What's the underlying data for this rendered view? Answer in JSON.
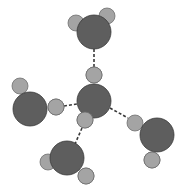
{
  "diagram": {
    "type": "molecular-structure",
    "colors": {
      "oxygen_fill": "#5e5e5e",
      "oxygen_stroke": "#3a3a3a",
      "hydrogen_fill": "#a4a4a4",
      "hydrogen_stroke": "#6e6e6e",
      "bond": "#3a3a3a",
      "background": "#ffffff"
    },
    "molecules": [
      {
        "id": "center",
        "oxygen": {
          "cx": 94,
          "cy": 101,
          "r": 17
        },
        "hydrogens": [
          {
            "cx": 94,
            "cy": 75,
            "r": 8
          },
          {
            "cx": 85,
            "cy": 120,
            "r": 8
          }
        ]
      },
      {
        "id": "top",
        "oxygen": {
          "cx": 94,
          "cy": 32,
          "r": 17
        },
        "hydrogens": [
          {
            "cx": 76,
            "cy": 23,
            "r": 8
          },
          {
            "cx": 107,
            "cy": 16,
            "r": 8
          }
        ]
      },
      {
        "id": "left",
        "oxygen": {
          "cx": 30,
          "cy": 109,
          "r": 17
        },
        "hydrogens": [
          {
            "cx": 20,
            "cy": 86,
            "r": 8
          },
          {
            "cx": 56,
            "cy": 107,
            "r": 8
          }
        ]
      },
      {
        "id": "bottom",
        "oxygen": {
          "cx": 67,
          "cy": 158,
          "r": 17
        },
        "hydrogens": [
          {
            "cx": 48,
            "cy": 162,
            "r": 8
          },
          {
            "cx": 86,
            "cy": 176,
            "r": 8
          }
        ]
      },
      {
        "id": "right",
        "oxygen": {
          "cx": 157,
          "cy": 135,
          "r": 17
        },
        "hydrogens": [
          {
            "cx": 135,
            "cy": 123,
            "r": 8
          },
          {
            "cx": 152,
            "cy": 160,
            "r": 8
          }
        ]
      }
    ],
    "hydrogen_bonds": [
      {
        "x1": 94,
        "y1": 49,
        "x2": 94,
        "y2": 67
      },
      {
        "x1": 64,
        "y1": 106,
        "x2": 77,
        "y2": 104
      },
      {
        "x1": 82,
        "y1": 128,
        "x2": 75,
        "y2": 144
      },
      {
        "x1": 110,
        "y1": 108,
        "x2": 128,
        "y2": 118
      }
    ]
  }
}
